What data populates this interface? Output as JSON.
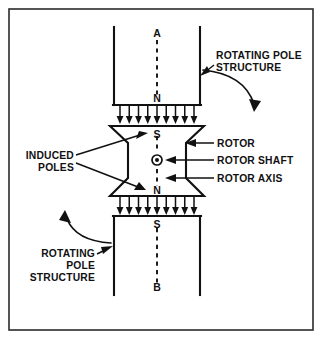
{
  "figure": {
    "background_color": "#ffffff",
    "line_color": "#111111",
    "frame_color": "#2b2b2b"
  },
  "axis_labels": {
    "top_end": "A",
    "top_pole": "N",
    "rotor_top_pole": "S",
    "rotor_bottom_pole": "N",
    "bottom_pole": "S",
    "bottom_end": "B"
  },
  "callouts": {
    "rotating_pole_structure_top": {
      "lines": [
        "ROTATING POLE",
        "STRUCTURE"
      ],
      "align": "left"
    },
    "rotating_pole_structure_bottom": {
      "lines": [
        "ROTATING",
        "POLE",
        "STRUCTURE"
      ],
      "align": "right"
    },
    "induced_poles": {
      "lines": [
        "INDUCED",
        "POLES"
      ],
      "align": "right"
    },
    "rotor": {
      "label": "ROTOR"
    },
    "rotor_shaft": {
      "label": "ROTOR SHAFT"
    },
    "rotor_axis": {
      "label": "ROTOR AXIS"
    }
  },
  "flux_gaps": {
    "top": {
      "arrow_count": 9,
      "direction": "down"
    },
    "bottom": {
      "arrow_count": 9,
      "direction": "down"
    }
  },
  "rotation_indicators": {
    "right": {
      "direction": "clockwise-down-right"
    },
    "left": {
      "direction": "counterclockwise-up-left"
    }
  },
  "shaft_symbol": {
    "name": "current-out-of-page",
    "glyph": "circle-with-dot"
  }
}
